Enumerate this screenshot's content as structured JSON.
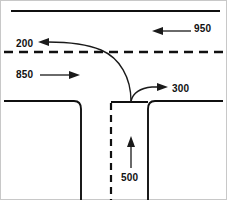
{
  "diagram": {
    "type": "t-intersection-traffic-flow",
    "colors": {
      "road": "#101010",
      "arrow": "#1a1a1a",
      "background": "#ffffff",
      "frame": "#c8c8c8"
    },
    "labels": {
      "northbound_left": "200",
      "eastbound_through": "950",
      "westbound_through": "850",
      "southbound_right": "300",
      "minor_approach": "500"
    },
    "movements": [
      {
        "name": "left-turn-out",
        "volume": "200",
        "direction": "west",
        "arrow": "left"
      },
      {
        "name": "through-westbound",
        "volume": "950",
        "direction": "west",
        "arrow": "left"
      },
      {
        "name": "through-eastbound",
        "volume": "850",
        "direction": "east",
        "arrow": "right"
      },
      {
        "name": "right-turn-out",
        "volume": "300",
        "direction": "east",
        "arrow": "right"
      },
      {
        "name": "minor-street-approach",
        "volume": "500",
        "direction": "north",
        "arrow": "up"
      }
    ]
  }
}
